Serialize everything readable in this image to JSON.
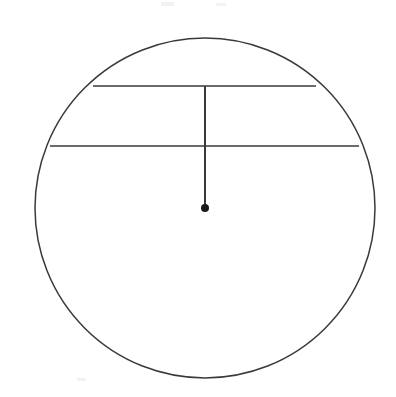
{
  "figure": {
    "background_color": "#ffffff",
    "canvas": {
      "width": 396,
      "height": 397
    },
    "ink_color": "#3a3a3a",
    "dot_color": "#1a1a1a",
    "elements": {
      "circle": {
        "name": "circle-outline",
        "center_x": 205,
        "center_y": 208,
        "radius": 170,
        "stroke_width": 1.5,
        "fill": "none"
      },
      "upper_chord": {
        "name": "upper-chord",
        "x1": 93,
        "y1": 86,
        "x2": 316,
        "y2": 86,
        "stroke_width": 1.6
      },
      "lower_chord": {
        "name": "lower-chord",
        "x1": 50,
        "y1": 146,
        "x2": 359,
        "y2": 146,
        "stroke_width": 1.6
      },
      "vertical_segment": {
        "name": "vertical-radius-segment",
        "x1": 205,
        "y1": 86,
        "x2": 205,
        "y2": 208,
        "stroke_width": 2.0
      },
      "center_dot": {
        "name": "center-point-dot",
        "cx": 205,
        "cy": 208,
        "r": 4.0
      }
    },
    "scan_specks": [
      {
        "left": 161,
        "top": 2,
        "width": 13,
        "height": 4
      },
      {
        "left": 216,
        "top": 3,
        "width": 10,
        "height": 3
      },
      {
        "left": 77,
        "top": 378,
        "width": 9,
        "height": 3
      }
    ]
  },
  "chart_data": {
    "type": "diagram",
    "geometry": {
      "circle": {
        "center": [
          205,
          208
        ],
        "radius": 170
      },
      "chords": [
        {
          "label": "upper chord",
          "y": 86,
          "x_start": 93,
          "x_end": 316,
          "length": 223,
          "distance_from_center": 122
        },
        {
          "label": "lower chord",
          "y": 146,
          "x_start": 50,
          "x_end": 359,
          "length": 309,
          "distance_from_center": 62
        }
      ],
      "segments": [
        {
          "label": "vertical segment from upper chord to center",
          "from": [
            205,
            86
          ],
          "to": [
            205,
            208
          ],
          "length": 122
        }
      ],
      "points": [
        {
          "label": "center",
          "at": [
            205,
            208
          ],
          "marker": "filled dot"
        },
        {
          "label": "upper chord midpoint",
          "at": [
            205,
            86
          ],
          "marker": "none"
        },
        {
          "label": "lower chord midpoint",
          "at": [
            205,
            146
          ],
          "marker": "none"
        }
      ]
    },
    "labels": [],
    "annotations": []
  }
}
